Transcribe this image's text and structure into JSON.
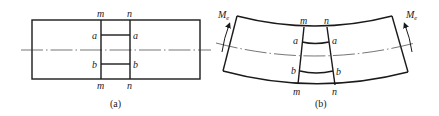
{
  "figure": {
    "panel_a": {
      "caption": "(a)",
      "top_labels": {
        "left": "m",
        "right": "n"
      },
      "bottom_labels": {
        "left": "m",
        "right": "n"
      },
      "fiber_a": {
        "left": "a",
        "right": "a"
      },
      "fiber_b": {
        "left": "b",
        "right": "b"
      }
    },
    "panel_b": {
      "caption": "(b)",
      "top_labels": {
        "left": "m",
        "right": "n"
      },
      "bottom_labels": {
        "left": "m",
        "right": "n"
      },
      "fiber_a": {
        "left": "a",
        "right": "a"
      },
      "fiber_b": {
        "left": "b",
        "right": "b"
      },
      "moment_left": {
        "symbol": "M",
        "subscript": "e"
      },
      "moment_right": {
        "symbol": "M",
        "subscript": "e"
      }
    },
    "colors": {
      "line": "#1a1a1a",
      "background": "#ffffff"
    }
  }
}
